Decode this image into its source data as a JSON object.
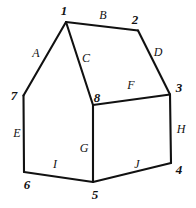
{
  "figure": {
    "canvas": {
      "width": 196,
      "height": 208
    },
    "stroke_color": "#111111",
    "background_color": "#ffffff",
    "label_color": "#121212",
    "stroke_width": 2.1
  },
  "vertices": [
    {
      "id": "v1",
      "label": "1",
      "x": 66,
      "y": 22,
      "label_x": 64,
      "label_y": 10
    },
    {
      "id": "v2",
      "label": "2",
      "x": 138,
      "y": 30,
      "label_x": 135,
      "label_y": 19
    },
    {
      "id": "v3",
      "label": "3",
      "x": 170,
      "y": 95,
      "label_x": 179,
      "label_y": 87
    },
    {
      "id": "v4",
      "label": "4",
      "x": 171,
      "y": 163,
      "label_x": 179,
      "label_y": 169
    },
    {
      "id": "v5",
      "label": "5",
      "x": 93,
      "y": 182,
      "label_x": 95,
      "label_y": 194
    },
    {
      "id": "v6",
      "label": "6",
      "x": 24,
      "y": 172,
      "label_x": 27,
      "label_y": 184
    },
    {
      "id": "v7",
      "label": "7",
      "x": 23,
      "y": 96,
      "label_x": 14,
      "label_y": 95
    },
    {
      "id": "v8",
      "label": "8",
      "x": 93,
      "y": 105,
      "label_x": 97,
      "label_y": 97
    }
  ],
  "edges": [
    {
      "id": "eA",
      "label": "A",
      "from": "v7",
      "to": "v1",
      "label_x": 36,
      "label_y": 53,
      "path": "M 23.5 95.5 L 66 22"
    },
    {
      "id": "eB",
      "label": "B",
      "from": "v1",
      "to": "v2",
      "label_x": 103,
      "label_y": 15,
      "path": "M 66 22 L 138 30.5"
    },
    {
      "id": "eC",
      "label": "C",
      "from": "v1",
      "to": "v8",
      "label_x": 86,
      "label_y": 58,
      "path": "M 66 22 L 93 105"
    },
    {
      "id": "eD",
      "label": "D",
      "from": "v2",
      "to": "v3",
      "label_x": 158,
      "label_y": 52,
      "path": "M 138 30.5 L 170 94.5"
    },
    {
      "id": "eE",
      "label": "E",
      "from": "v7",
      "to": "v6",
      "label_x": 17,
      "label_y": 133,
      "path": "M 23.5 95.5 L 24 172"
    },
    {
      "id": "eF",
      "label": "F",
      "from": "v8",
      "to": "v3",
      "label_x": 131,
      "label_y": 85,
      "path": "M 93 105 L 170 94.5"
    },
    {
      "id": "eG",
      "label": "G",
      "from": "v8",
      "to": "v5",
      "label_x": 84,
      "label_y": 148,
      "path": "M 93 105 L 93 182"
    },
    {
      "id": "eH",
      "label": "H",
      "from": "v3",
      "to": "v4",
      "label_x": 181,
      "label_y": 129,
      "path": "M 170 94.5 L 171 163"
    },
    {
      "id": "eI",
      "label": "I",
      "from": "v6",
      "to": "v5",
      "label_x": 55,
      "label_y": 164,
      "path": "M 24 172 L 93 182"
    },
    {
      "id": "eJ",
      "label": "J",
      "from": "v5",
      "to": "v4",
      "label_x": 137,
      "label_y": 164,
      "path": "M 93 182 L 171 163"
    }
  ]
}
